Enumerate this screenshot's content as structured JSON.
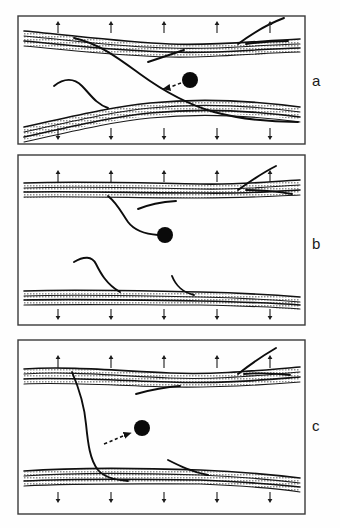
{
  "figure": {
    "type": "scientific-diagram",
    "width": 340,
    "height": 528,
    "background_color": "#ffffff",
    "line_color": "#111111",
    "marker_color": "#0a0a0a",
    "frame_color": "#3a3a3a"
  },
  "panels": [
    {
      "id": "a",
      "label": "a",
      "label_x": 313,
      "label_y": 82,
      "frame": {
        "x": 18,
        "y": 16,
        "width": 287,
        "height": 128
      },
      "top_arrows": {
        "direction": "up",
        "count": 5,
        "y": 28,
        "xs": [
          58,
          111,
          164,
          217,
          270
        ]
      },
      "bottom_arrows": {
        "direction": "down",
        "count": 5,
        "y": 132,
        "xs": [
          58,
          111,
          164,
          217,
          270
        ]
      },
      "marker_dot": {
        "x": 190,
        "y": 80,
        "r": 8
      },
      "dashed_arrow": {
        "from_x": 182,
        "from_y": 83,
        "to_x": 160,
        "to_y": 89,
        "points_to": "curve"
      }
    },
    {
      "id": "b",
      "label": "b",
      "label_x": 313,
      "label_y": 245,
      "frame": {
        "x": 18,
        "y": 155,
        "width": 287,
        "height": 170
      },
      "top_arrows": {
        "direction": "up",
        "count": 5,
        "y": 176,
        "xs": [
          58,
          111,
          164,
          217,
          270
        ]
      },
      "bottom_arrows": {
        "direction": "down",
        "count": 5,
        "y": 313,
        "xs": [
          58,
          111,
          164,
          217,
          270
        ]
      },
      "marker_dot": {
        "x": 165,
        "y": 234,
        "r": 8
      },
      "dashed_arrow": null
    },
    {
      "id": "c",
      "label": "c",
      "label_x": 313,
      "label_y": 427,
      "frame": {
        "x": 18,
        "y": 338,
        "width": 287,
        "height": 174
      },
      "top_arrows": {
        "direction": "up",
        "count": 5,
        "y": 358,
        "xs": [
          58,
          111,
          164,
          217,
          270
        ]
      },
      "bottom_arrows": {
        "direction": "down",
        "count": 5,
        "y": 497,
        "xs": [
          58,
          111,
          164,
          217,
          270
        ]
      },
      "marker_dot": {
        "x": 142,
        "y": 428,
        "r": 8
      },
      "dashed_arrow": {
        "from_x": 105,
        "from_y": 444,
        "to_x": 133,
        "to_y": 433,
        "points_to": "dot"
      }
    }
  ],
  "legend": {
    "up_arrow_glyph": "↑",
    "down_arrow_glyph": "↓",
    "dot_name": "marker-dot",
    "band_name": "deformation-band"
  }
}
